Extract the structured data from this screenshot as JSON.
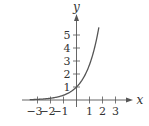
{
  "chart_data": {
    "type": "line",
    "title": "",
    "xlabel": "x",
    "ylabel": "y",
    "function": "y = e^x",
    "xlim": [
      -3.6,
      4.2
    ],
    "ylim": [
      0,
      6.5
    ],
    "x_ticks": [
      -3,
      -2,
      -1,
      1,
      2,
      3
    ],
    "x_tick_labels": [
      "−3",
      "−2",
      "−1",
      "1",
      "2",
      "3"
    ],
    "y_ticks": [
      1,
      2,
      3,
      4,
      5
    ],
    "y_tick_labels": [
      "1",
      "2",
      "3",
      "4",
      "5"
    ],
    "grid": false,
    "legend": null,
    "series": [
      {
        "name": "exponential curve",
        "x": [
          -3.5,
          -3,
          -2.5,
          -2,
          -1.5,
          -1,
          -0.5,
          0,
          0.5,
          1,
          1.25,
          1.5,
          1.75
        ],
        "y": [
          0.03,
          0.05,
          0.08,
          0.14,
          0.22,
          0.37,
          0.61,
          1.0,
          1.65,
          2.72,
          3.49,
          4.48,
          5.75
        ]
      }
    ],
    "colors": {
      "curve": "#555555",
      "axes": "#555555",
      "text": "#333333"
    }
  }
}
